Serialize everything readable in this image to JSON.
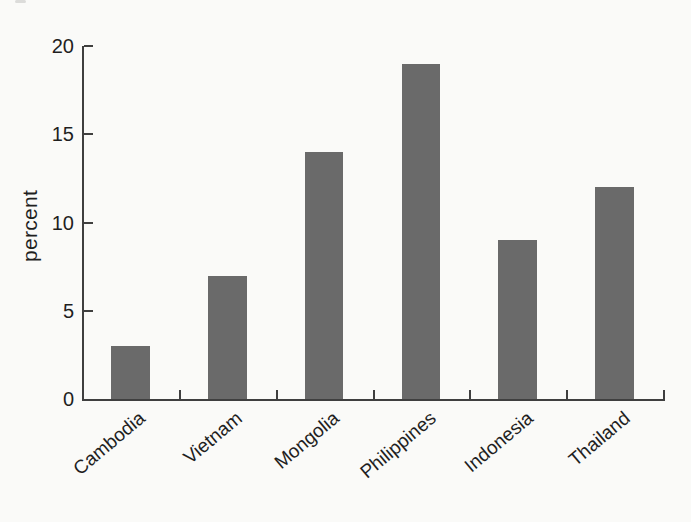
{
  "figure": {
    "background": "#fafaf8",
    "bar_color": "#6a6a6a",
    "axis_color": "#3f3f3f",
    "text_color": "#1f1f1f"
  },
  "chart_data": {
    "type": "bar",
    "title": "",
    "xlabel": "",
    "ylabel": "percent",
    "categories": [
      "Cambodia",
      "Vietnam",
      "Mongolia",
      "Philippines",
      "Indonesia",
      "Thailand"
    ],
    "values": [
      3,
      7,
      14,
      19,
      9,
      12
    ],
    "ylim": [
      0,
      20
    ],
    "yticks": [
      0,
      5,
      10,
      15,
      20
    ],
    "grid": false,
    "legend": false,
    "x_tick_label_rotation_deg": 40,
    "bar_width_fraction": 0.4
  }
}
